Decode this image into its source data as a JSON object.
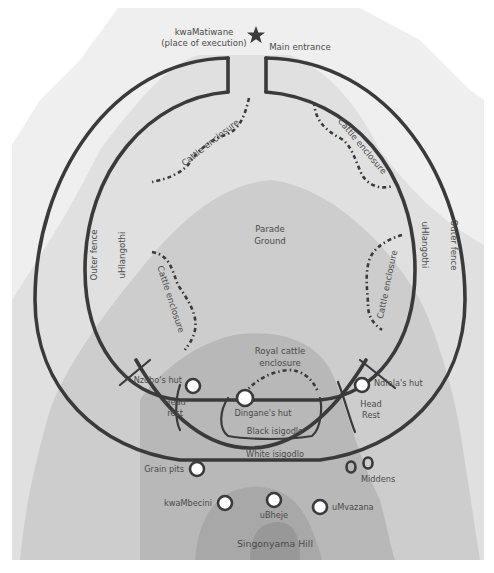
{
  "colors": {
    "background": "#ffffff",
    "zone_lightest": "#ececec",
    "zone_light": "#dcdcdc",
    "zone_medium": "#c8c8c8",
    "zone_dark": "#b4b4b4",
    "zone_hill_top": "#a2a2a2",
    "fence_stroke": "#3a3a3a",
    "hut_fill": "#ffffff",
    "text": "#4a4a4a"
  },
  "landmarks": {
    "execution_place": {
      "line1": "kwaMatiwane",
      "line2": "(place of execution)",
      "icon": "star-icon"
    },
    "main_entrance": "Main entrance"
  },
  "fences": {
    "outer_left": "Outer fence",
    "outer_right": "Outer fence",
    "inner_left": "uHlangothi",
    "inner_right": "uHlangothi"
  },
  "enclosures": {
    "cattle_top_left": "Cattle enclosure",
    "cattle_top_right": "Cattle enclosure",
    "cattle_mid_left": "Cattle enclosure",
    "cattle_mid_right": "Cattle enclosure",
    "royal_line1": "Royal cattle",
    "royal_line2": "enclosure"
  },
  "areas": {
    "parade_line1": "Parade",
    "parade_line2": "Ground",
    "black_isigodlo": "Black isigodlo",
    "white_isigodlo": "White isigodlo",
    "head_rest_left_line1": "Head",
    "head_rest_left_line2": "rest",
    "head_rest_right_line1": "Head",
    "head_rest_right_line2": "Rest"
  },
  "huts": {
    "nzobo": "Nzobo's hut",
    "dingane": "Dingane's hut",
    "ndlela": "Ndlela's hut",
    "grain_pits": "Grain pits",
    "middens": "Middens",
    "kwambecini": "kwaMbecini",
    "ubheje": "uBheje",
    "umvazana": "uMvazana"
  },
  "hill": "Singonyama Hill"
}
